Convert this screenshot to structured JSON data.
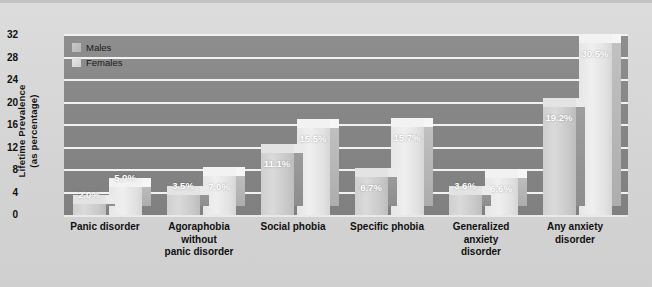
{
  "chart_data": {
    "type": "bar",
    "title": "",
    "subtitle": "",
    "xlabel": "",
    "ylabel": "Lifetime Prevalence\n(as percentage)",
    "ylabel_line1": "Lifetime Prevalence",
    "ylabel_line2": "(as percentage)",
    "ylim": [
      0,
      32
    ],
    "yticks": [
      32,
      28,
      24,
      20,
      16,
      12,
      8,
      4,
      0
    ],
    "ytick_labels": [
      "32",
      "28",
      "24",
      "20",
      "16",
      "12",
      "8",
      "4",
      "0"
    ],
    "grid": true,
    "grid_orientation": "horizontal",
    "legend_position": "top-left",
    "categories": [
      "Panic disorder",
      "Agoraphobia without panic disorder",
      "Social phobia",
      "Specific phobia",
      "Generalized anxiety disorder",
      "Any anxiety disorder"
    ],
    "category_lines": [
      [
        "Panic disorder"
      ],
      [
        "Agoraphobia",
        "without",
        "panic disorder"
      ],
      [
        "Social phobia"
      ],
      [
        "Specific phobia"
      ],
      [
        "Generalized",
        "anxiety",
        "disorder"
      ],
      [
        "Any anxiety",
        "disorder"
      ]
    ],
    "series": [
      {
        "name": "Males",
        "color": "#cccccc",
        "values": [
          2.0,
          3.5,
          11.1,
          6.7,
          3.6,
          19.2
        ],
        "labels": [
          "2.0%",
          "3.5%",
          "11.1%",
          "6.7%",
          "3.6%",
          "19.2%"
        ]
      },
      {
        "name": "Females",
        "color": "#e8e8e8",
        "values": [
          5.0,
          7.0,
          15.5,
          15.7,
          6.6,
          30.5
        ],
        "labels": [
          "5.0%",
          "7.0%",
          "15.5%",
          "15.7%",
          "6.6%",
          "30.5%"
        ]
      }
    ]
  },
  "legend": {
    "items": [
      {
        "label": "Males",
        "key": "males"
      },
      {
        "label": "Females",
        "key": "females"
      }
    ]
  },
  "colors": {
    "figure_background": "#d8d8d8",
    "plot_background": "#878787",
    "gridline": "#f2f2f2",
    "text": "#111111",
    "value_label": "#ffffff"
  }
}
